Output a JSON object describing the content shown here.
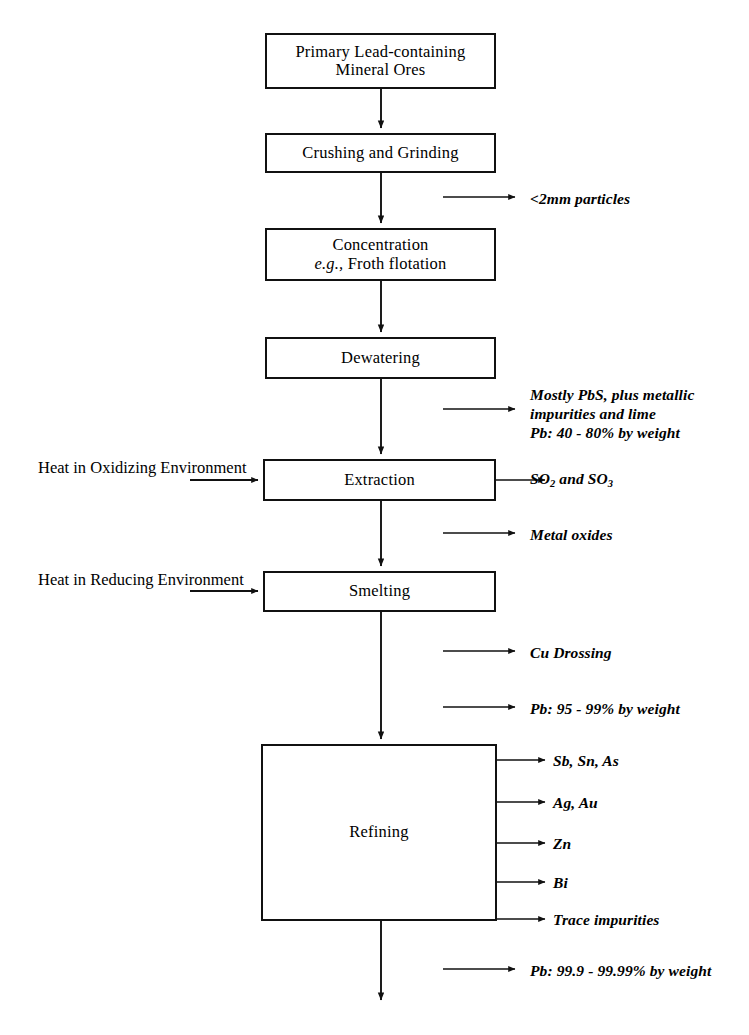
{
  "diagram": {
    "line_color": "#111111",
    "background": "#ffffff",
    "nodes": [
      {
        "id": "ore",
        "lines": [
          "Primary Lead-containing",
          "Mineral Ores"
        ],
        "x": 265,
        "y": 33,
        "w": 231,
        "h": 56
      },
      {
        "id": "crushing",
        "lines": [
          "Crushing and Grinding"
        ],
        "x": 265,
        "y": 133,
        "w": 231,
        "h": 40
      },
      {
        "id": "concentration",
        "lines": [
          "Concentration",
          "e.g., Froth flotation"
        ],
        "x": 265,
        "y": 228,
        "w": 231,
        "h": 53
      },
      {
        "id": "dewatering",
        "lines": [
          "Dewatering"
        ],
        "x": 265,
        "y": 337,
        "w": 231,
        "h": 42
      },
      {
        "id": "extraction",
        "lines": [
          "Extraction"
        ],
        "x": 263,
        "y": 459,
        "w": 233,
        "h": 42
      },
      {
        "id": "smelting",
        "lines": [
          "Smelting"
        ],
        "x": 263,
        "y": 571,
        "w": 233,
        "h": 41
      },
      {
        "id": "refining",
        "lines": [
          "Refining"
        ],
        "x": 261,
        "y": 744,
        "w": 236,
        "h": 177
      }
    ],
    "input_labels": [
      {
        "id": "heat-oxidizing",
        "lines": [
          "Heat in Oxidizing",
          "Environment"
        ],
        "x": 38,
        "y": 459,
        "w": 175
      },
      {
        "id": "heat-reducing",
        "lines": [
          "Heat in Reducing",
          "Environment"
        ],
        "x": 38,
        "y": 571,
        "w": 175
      }
    ],
    "output_labels": [
      {
        "id": "particles",
        "lines": [
          "<2mm particles"
        ],
        "x": 530,
        "y": 190
      },
      {
        "id": "feed-comp",
        "lines": [
          "Mostly PbS, plus metallic",
          "impurities and lime",
          "Pb: 40 - 80% by weight"
        ],
        "x": 530,
        "y": 386
      },
      {
        "id": "sox",
        "lines": [
          "SO2 and SO3"
        ],
        "html": "SO<sub>2</sub> and SO<sub>3</sub>",
        "x": 530,
        "y": 470
      },
      {
        "id": "metal-oxides",
        "lines": [
          "Metal oxides"
        ],
        "x": 530,
        "y": 526
      },
      {
        "id": "cu-drossing",
        "lines": [
          "Cu Drossing"
        ],
        "x": 530,
        "y": 644
      },
      {
        "id": "pb-95-99",
        "lines": [
          "Pb: 95 - 99% by weight"
        ],
        "x": 530,
        "y": 700
      },
      {
        "id": "sb-sn-as",
        "lines": [
          "Sb, Sn, As"
        ],
        "x": 553,
        "y": 752
      },
      {
        "id": "ag-au",
        "lines": [
          "Ag, Au"
        ],
        "x": 553,
        "y": 794
      },
      {
        "id": "zn",
        "lines": [
          "Zn"
        ],
        "x": 553,
        "y": 835
      },
      {
        "id": "bi",
        "lines": [
          "Bi"
        ],
        "x": 553,
        "y": 874
      },
      {
        "id": "trace",
        "lines": [
          "Trace impurities"
        ],
        "x": 553,
        "y": 911
      },
      {
        "id": "pb-999",
        "lines": [
          "Pb: 99.9 - 99.99% by weight"
        ],
        "x": 530,
        "y": 962
      }
    ],
    "caption_partial": ""
  }
}
